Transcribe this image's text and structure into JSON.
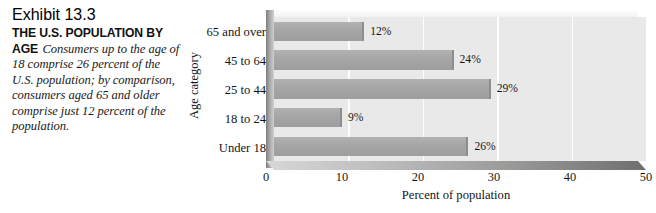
{
  "caption": {
    "exhibit_number": "Exhibit 13.3",
    "heading": "THE U.S. POPULATION BY AGE",
    "body": "Consumers up to the age of 18 comprise 26 percent of the U.S. population; by comparison, consumers aged 65 and older comprise just 12 percent of the population."
  },
  "chart_data": {
    "type": "bar",
    "orientation": "horizontal",
    "title": "THE U.S. POPULATION BY AGE",
    "xlabel": "Percent of population",
    "ylabel": "Age category",
    "xlim": [
      0,
      50
    ],
    "xticks": [
      "0",
      "10",
      "20",
      "30",
      "40",
      "50"
    ],
    "xtick_values": [
      0,
      10,
      20,
      30,
      40,
      50
    ],
    "grid": "vertical",
    "legend": "none",
    "categories": [
      "65 and over",
      "45 to 64",
      "25 to 44",
      "18 to 24",
      "Under 18"
    ],
    "values": [
      12,
      24,
      29,
      9,
      26
    ],
    "data_labels": [
      "12%",
      "24%",
      "29%",
      "9%",
      "26%"
    ],
    "colors": {
      "bar": "#a6a6a6",
      "panel": "#e9e9e9",
      "gridline": "#fdfdfd",
      "floor": "#8d8d8d",
      "text": "#141414"
    }
  }
}
